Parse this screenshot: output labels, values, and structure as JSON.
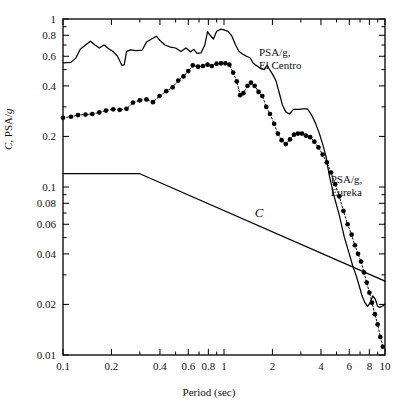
{
  "chart_data": {
    "type": "line",
    "title": "",
    "xlabel": "Period (sec)",
    "ylabel": "C, PSA/g",
    "xscale": "log",
    "yscale": "log",
    "xlim": [
      0.1,
      10
    ],
    "ylim": [
      0.01,
      1
    ],
    "grid": false,
    "legend_position": "inline-annotations",
    "xticks": [
      0.1,
      0.2,
      0.4,
      0.6,
      0.8,
      1,
      2,
      4,
      6,
      8,
      10
    ],
    "xticklabels": [
      "0.1",
      "0.2",
      "0.4",
      "0.6",
      "0.8",
      "1",
      "2",
      "4",
      "6",
      "8",
      "10"
    ],
    "yticks": [
      0.01,
      0.02,
      0.04,
      0.06,
      0.08,
      0.1,
      0.2,
      0.4,
      0.6,
      0.8,
      1
    ],
    "yticklabels": [
      "0.01",
      "0.02",
      "0.04",
      "0.06",
      "0.08",
      "0.1",
      "0.2",
      "0.4",
      "0.6",
      "0.8",
      "1"
    ],
    "annotations": [
      {
        "name": "el-centro-label",
        "text_line1": "PSA/g,",
        "text_line2": "El Centro",
        "x": 1.65,
        "y": 0.6
      },
      {
        "name": "eureka-label",
        "text_line1": "PSA/g,",
        "text_line2": "Eureka",
        "x": 4.6,
        "y": 0.105
      },
      {
        "name": "code-curve-label",
        "text": "C",
        "x": 1.55,
        "y": 0.066
      }
    ],
    "series": [
      {
        "name": "PSA/g, El Centro",
        "style": "solid-line",
        "marker": "none",
        "color": "#000000",
        "points": [
          [
            0.1,
            0.548
          ],
          [
            0.112,
            0.552
          ],
          [
            0.12,
            0.585
          ],
          [
            0.128,
            0.66
          ],
          [
            0.138,
            0.7
          ],
          [
            0.148,
            0.737
          ],
          [
            0.158,
            0.7
          ],
          [
            0.168,
            0.672
          ],
          [
            0.18,
            0.7
          ],
          [
            0.192,
            0.665
          ],
          [
            0.205,
            0.64
          ],
          [
            0.218,
            0.6
          ],
          [
            0.232,
            0.53
          ],
          [
            0.24,
            0.533
          ],
          [
            0.248,
            0.64
          ],
          [
            0.262,
            0.655
          ],
          [
            0.285,
            0.648
          ],
          [
            0.31,
            0.652
          ],
          [
            0.33,
            0.73
          ],
          [
            0.355,
            0.76
          ],
          [
            0.38,
            0.79
          ],
          [
            0.4,
            0.745
          ],
          [
            0.43,
            0.7
          ],
          [
            0.465,
            0.68
          ],
          [
            0.5,
            0.672
          ],
          [
            0.54,
            0.64
          ],
          [
            0.58,
            0.672
          ],
          [
            0.62,
            0.638
          ],
          [
            0.65,
            0.66
          ],
          [
            0.68,
            0.625
          ],
          [
            0.72,
            0.628
          ],
          [
            0.76,
            0.7
          ],
          [
            0.79,
            0.84
          ],
          [
            0.82,
            0.8
          ],
          [
            0.86,
            0.76
          ],
          [
            0.9,
            0.845
          ],
          [
            0.96,
            0.87
          ],
          [
            1.0,
            0.862
          ],
          [
            1.06,
            0.845
          ],
          [
            1.12,
            0.79
          ],
          [
            1.18,
            0.7
          ],
          [
            1.24,
            0.64
          ],
          [
            1.3,
            0.62
          ],
          [
            1.38,
            0.6
          ],
          [
            1.45,
            0.588
          ],
          [
            1.52,
            0.545
          ],
          [
            1.58,
            0.53
          ],
          [
            1.64,
            0.518
          ],
          [
            1.7,
            0.505
          ],
          [
            1.78,
            0.5
          ],
          [
            1.85,
            0.53
          ],
          [
            1.92,
            0.5
          ],
          [
            2.0,
            0.47
          ],
          [
            2.1,
            0.43
          ],
          [
            2.2,
            0.365
          ],
          [
            2.3,
            0.31
          ],
          [
            2.42,
            0.28
          ],
          [
            2.55,
            0.272
          ],
          [
            2.7,
            0.29
          ],
          [
            2.9,
            0.29
          ],
          [
            3.1,
            0.292
          ],
          [
            3.3,
            0.292
          ],
          [
            3.5,
            0.268
          ],
          [
            3.7,
            0.24
          ],
          [
            3.9,
            0.21
          ],
          [
            4.1,
            0.18
          ],
          [
            4.3,
            0.152
          ],
          [
            4.5,
            0.118
          ],
          [
            4.8,
            0.09
          ],
          [
            5.2,
            0.068
          ],
          [
            5.6,
            0.05
          ],
          [
            6.0,
            0.04
          ],
          [
            6.3,
            0.034
          ],
          [
            6.6,
            0.03
          ],
          [
            6.9,
            0.026
          ],
          [
            7.2,
            0.0225
          ],
          [
            7.5,
            0.0205
          ],
          [
            7.8,
            0.0195
          ],
          [
            8.1,
            0.0205
          ],
          [
            8.4,
            0.0225
          ],
          [
            8.7,
            0.0215
          ],
          [
            9.0,
            0.0195
          ],
          [
            9.3,
            0.0192
          ],
          [
            9.6,
            0.0195
          ],
          [
            10.0,
            0.02
          ]
        ]
      },
      {
        "name": "PSA/g, Eureka",
        "style": "dotted-line",
        "marker": "filled-circle",
        "color": "#000000",
        "points": [
          [
            0.1,
            0.258
          ],
          [
            0.112,
            0.262
          ],
          [
            0.124,
            0.268
          ],
          [
            0.138,
            0.27
          ],
          [
            0.152,
            0.272
          ],
          [
            0.168,
            0.278
          ],
          [
            0.185,
            0.285
          ],
          [
            0.205,
            0.29
          ],
          [
            0.225,
            0.288
          ],
          [
            0.248,
            0.292
          ],
          [
            0.272,
            0.318
          ],
          [
            0.3,
            0.328
          ],
          [
            0.33,
            0.332
          ],
          [
            0.362,
            0.32
          ],
          [
            0.398,
            0.348
          ],
          [
            0.438,
            0.372
          ],
          [
            0.48,
            0.392
          ],
          [
            0.52,
            0.43
          ],
          [
            0.56,
            0.455
          ],
          [
            0.6,
            0.49
          ],
          [
            0.64,
            0.53
          ],
          [
            0.69,
            0.52
          ],
          [
            0.74,
            0.525
          ],
          [
            0.79,
            0.535
          ],
          [
            0.84,
            0.525
          ],
          [
            0.9,
            0.542
          ],
          [
            0.96,
            0.545
          ],
          [
            1.02,
            0.545
          ],
          [
            1.08,
            0.535
          ],
          [
            1.14,
            0.48
          ],
          [
            1.2,
            0.425
          ],
          [
            1.26,
            0.352
          ],
          [
            1.32,
            0.362
          ],
          [
            1.4,
            0.4
          ],
          [
            1.47,
            0.418
          ],
          [
            1.55,
            0.4
          ],
          [
            1.64,
            0.368
          ],
          [
            1.73,
            0.348
          ],
          [
            1.83,
            0.3
          ],
          [
            1.93,
            0.272
          ],
          [
            2.05,
            0.238
          ],
          [
            2.16,
            0.208
          ],
          [
            2.28,
            0.19
          ],
          [
            2.42,
            0.18
          ],
          [
            2.57,
            0.192
          ],
          [
            2.72,
            0.205
          ],
          [
            2.88,
            0.208
          ],
          [
            3.05,
            0.208
          ],
          [
            3.23,
            0.202
          ],
          [
            3.43,
            0.198
          ],
          [
            3.64,
            0.186
          ],
          [
            3.86,
            0.172
          ],
          [
            4.1,
            0.156
          ],
          [
            4.35,
            0.14
          ],
          [
            4.62,
            0.122
          ],
          [
            4.9,
            0.104
          ],
          [
            5.2,
            0.088
          ],
          [
            5.52,
            0.072
          ],
          [
            5.86,
            0.06
          ],
          [
            6.2,
            0.052
          ],
          [
            6.5,
            0.045
          ],
          [
            6.8,
            0.04
          ],
          [
            7.1,
            0.036
          ],
          [
            7.4,
            0.031
          ],
          [
            7.7,
            0.027
          ],
          [
            8.0,
            0.0235
          ],
          [
            8.3,
            0.0205
          ],
          [
            8.65,
            0.0175
          ],
          [
            9.0,
            0.0152
          ],
          [
            9.35,
            0.0128
          ],
          [
            9.7,
            0.0112
          ]
        ]
      },
      {
        "name": "C",
        "style": "solid-line",
        "marker": "none",
        "color": "#000000",
        "points": [
          [
            0.1,
            0.12
          ],
          [
            0.3,
            0.12
          ],
          [
            10.0,
            0.0275
          ]
        ]
      }
    ]
  }
}
